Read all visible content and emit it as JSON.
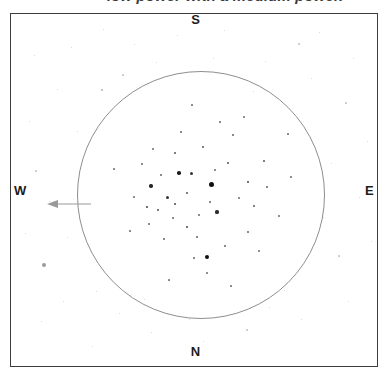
{
  "caption": {
    "text": "low power with a medium power."
  },
  "chart_data": {
    "type": "scatter",
    "xlabel": "",
    "ylabel": "",
    "xlim": [
      0,
      368
    ],
    "ylim": [
      0,
      354
    ],
    "grid": false,
    "legend_position": "none",
    "annotations": [
      {
        "name": "field-of-view-circle",
        "shape": "circle",
        "cx": 201,
        "cy": 192,
        "r": 124,
        "color": "#8e8e8e"
      },
      {
        "name": "west-direction-arrow",
        "shape": "arrow",
        "x1": 78,
        "y1": 190,
        "x2": 38,
        "y2": 190,
        "color": "#9a9a9a"
      }
    ],
    "compass": {
      "top": "S",
      "bottom": "N",
      "left": "W",
      "right": "E"
    },
    "series": [
      {
        "name": "cluster-stars",
        "description": "Bright cluster members inside the field of view circle",
        "color": "#101010",
        "points": [
          {
            "x": 210,
            "y": 183,
            "mag": 5.0
          },
          {
            "x": 178,
            "y": 172,
            "mag": 3.6
          },
          {
            "x": 206,
            "y": 256,
            "mag": 4.2
          },
          {
            "x": 150,
            "y": 185,
            "mag": 3.4
          },
          {
            "x": 190,
            "y": 172,
            "mag": 3.0
          },
          {
            "x": 166,
            "y": 196,
            "mag": 3.0
          },
          {
            "x": 146,
            "y": 206,
            "mag": 2.8
          },
          {
            "x": 174,
            "y": 203,
            "mag": 2.6
          },
          {
            "x": 157,
            "y": 209,
            "mag": 2.4
          },
          {
            "x": 216,
            "y": 211,
            "mag": 3.2
          },
          {
            "x": 186,
            "y": 226,
            "mag": 2.6
          },
          {
            "x": 227,
            "y": 162,
            "mag": 2.4
          },
          {
            "x": 247,
            "y": 181,
            "mag": 2.6
          },
          {
            "x": 202,
            "y": 146,
            "mag": 2.2
          },
          {
            "x": 174,
            "y": 152,
            "mag": 2.4
          },
          {
            "x": 232,
            "y": 134,
            "mag": 2.0
          },
          {
            "x": 253,
            "y": 205,
            "mag": 2.2
          },
          {
            "x": 196,
            "y": 236,
            "mag": 2.0
          },
          {
            "x": 163,
            "y": 238,
            "mag": 2.0
          },
          {
            "x": 224,
            "y": 245,
            "mag": 2.0
          },
          {
            "x": 141,
            "y": 163,
            "mag": 2.0
          },
          {
            "x": 263,
            "y": 160,
            "mag": 2.2
          },
          {
            "x": 209,
            "y": 201,
            "mag": 2.0
          },
          {
            "x": 186,
            "y": 192,
            "mag": 2.2
          },
          {
            "x": 198,
            "y": 214,
            "mag": 1.8
          },
          {
            "x": 238,
            "y": 197,
            "mag": 1.8
          },
          {
            "x": 160,
            "y": 174,
            "mag": 1.8
          },
          {
            "x": 214,
            "y": 169,
            "mag": 1.8
          },
          {
            "x": 172,
            "y": 217,
            "mag": 1.8
          },
          {
            "x": 148,
            "y": 223,
            "mag": 1.6
          },
          {
            "x": 193,
            "y": 257,
            "mag": 1.6
          },
          {
            "x": 247,
            "y": 231,
            "mag": 1.6
          },
          {
            "x": 266,
            "y": 186,
            "mag": 1.6
          },
          {
            "x": 219,
            "y": 121,
            "mag": 1.6
          },
          {
            "x": 180,
            "y": 131,
            "mag": 1.6
          },
          {
            "x": 152,
            "y": 148,
            "mag": 1.4
          },
          {
            "x": 278,
            "y": 215,
            "mag": 1.4
          },
          {
            "x": 206,
            "y": 272,
            "mag": 1.4
          },
          {
            "x": 133,
            "y": 196,
            "mag": 1.4
          },
          {
            "x": 243,
            "y": 116,
            "mag": 1.4
          },
          {
            "x": 258,
            "y": 250,
            "mag": 1.4
          },
          {
            "x": 129,
            "y": 230,
            "mag": 1.2
          },
          {
            "x": 290,
            "y": 176,
            "mag": 1.2
          },
          {
            "x": 168,
            "y": 279,
            "mag": 1.2
          },
          {
            "x": 230,
            "y": 285,
            "mag": 1.2
          },
          {
            "x": 113,
            "y": 168,
            "mag": 1.2
          },
          {
            "x": 287,
            "y": 133,
            "mag": 1.2
          },
          {
            "x": 191,
            "y": 104,
            "mag": 1.2
          }
        ]
      },
      {
        "name": "outer-field-stars",
        "description": "Faint field stars outside the field of view circle",
        "color": "#9b9b9b",
        "points": [
          {
            "x": 43,
            "y": 264,
            "mag": 4.0
          },
          {
            "x": 101,
            "y": 89,
            "mag": 2.6
          },
          {
            "x": 35,
            "y": 170,
            "mag": 2.0
          },
          {
            "x": 122,
            "y": 74,
            "mag": 1.6
          },
          {
            "x": 298,
            "y": 43,
            "mag": 1.2
          },
          {
            "x": 345,
            "y": 102,
            "mag": 1.2
          },
          {
            "x": 338,
            "y": 255,
            "mag": 1.2
          },
          {
            "x": 246,
            "y": 329,
            "mag": 1.2
          },
          {
            "x": 102,
            "y": 28,
            "mag": 1.0
          },
          {
            "x": 33,
            "y": 54,
            "mag": 1.0
          },
          {
            "x": 70,
            "y": 46,
            "mag": 1.0
          },
          {
            "x": 133,
            "y": 43,
            "mag": 1.0
          },
          {
            "x": 176,
            "y": 34,
            "mag": 1.0
          },
          {
            "x": 223,
            "y": 29,
            "mag": 1.0
          },
          {
            "x": 264,
            "y": 60,
            "mag": 1.0
          },
          {
            "x": 318,
            "y": 31,
            "mag": 1.0
          },
          {
            "x": 352,
            "y": 57,
            "mag": 1.0
          },
          {
            "x": 366,
            "y": 140,
            "mag": 1.0
          },
          {
            "x": 358,
            "y": 196,
            "mag": 1.0
          },
          {
            "x": 347,
            "y": 300,
            "mag": 1.0
          },
          {
            "x": 300,
            "y": 318,
            "mag": 1.0
          },
          {
            "x": 202,
            "y": 340,
            "mag": 1.0
          },
          {
            "x": 150,
            "y": 331,
            "mag": 1.0
          },
          {
            "x": 91,
            "y": 345,
            "mag": 1.0
          },
          {
            "x": 40,
            "y": 320,
            "mag": 1.0
          },
          {
            "x": 24,
            "y": 232,
            "mag": 1.0
          },
          {
            "x": 28,
            "y": 120,
            "mag": 1.0
          },
          {
            "x": 62,
            "y": 300,
            "mag": 1.0
          },
          {
            "x": 118,
            "y": 312,
            "mag": 1.0
          },
          {
            "x": 283,
            "y": 289,
            "mag": 1.0
          },
          {
            "x": 322,
            "y": 216,
            "mag": 1.0
          },
          {
            "x": 310,
            "y": 77,
            "mag": 1.0
          },
          {
            "x": 155,
            "y": 61,
            "mag": 1.0
          },
          {
            "x": 76,
            "y": 130,
            "mag": 1.0
          },
          {
            "x": 48,
            "y": 200,
            "mag": 1.0
          },
          {
            "x": 66,
            "y": 236,
            "mag": 1.0
          },
          {
            "x": 95,
            "y": 290,
            "mag": 1.0
          },
          {
            "x": 268,
            "y": 306,
            "mag": 1.0
          },
          {
            "x": 330,
            "y": 162,
            "mag": 1.0
          },
          {
            "x": 212,
            "y": 57,
            "mag": 1.0
          },
          {
            "x": 56,
            "y": 88,
            "mag": 1.0
          },
          {
            "x": 370,
            "y": 240,
            "mag": 1.0
          },
          {
            "x": 188,
            "y": 318,
            "mag": 1.0
          },
          {
            "x": 252,
            "y": 90,
            "mag": 1.0
          },
          {
            "x": 143,
            "y": 298,
            "mag": 1.0
          }
        ]
      }
    ]
  }
}
